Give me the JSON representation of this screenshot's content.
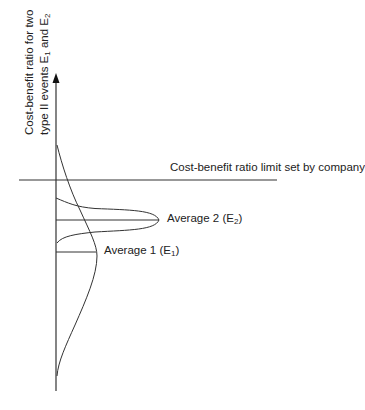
{
  "diagram": {
    "y_axis_label": {
      "line1": "Cost-benefit ratio for two",
      "line2_prefix": "type II events E",
      "line2_sub1": "1",
      "line2_mid": " and E",
      "line2_sub2": "2"
    },
    "limit_line_label": "Cost-benefit ratio limit set by company",
    "average2": {
      "prefix": "Average 2 (E",
      "sub": "2",
      "suffix": ")"
    },
    "average1": {
      "prefix": "Average 1 (E",
      "sub": "1",
      "suffix": ")"
    },
    "colors": {
      "line": "#333333",
      "text": "#222222",
      "background": "#ffffff"
    }
  }
}
